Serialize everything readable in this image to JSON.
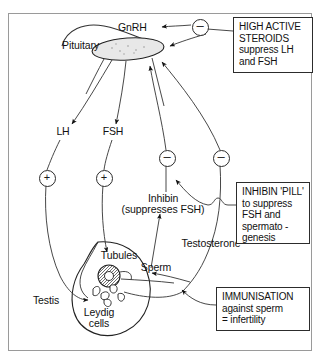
{
  "diagram": {
    "frame": {
      "border_color": "#9a9a9a"
    },
    "organs": [
      {
        "name": "pituitary",
        "label": "Pituitary",
        "x": 98,
        "y": 46
      },
      {
        "name": "testis",
        "label": "Testis",
        "x": 46,
        "y": 300
      },
      {
        "name": "tubules",
        "label": "Tubules",
        "x": 119,
        "y": 255
      },
      {
        "name": "leydig-cells",
        "label": "Leydig\ncells",
        "line1": "Leydig",
        "line2": "cells",
        "x": 99,
        "y": 312
      }
    ],
    "hormones": [
      {
        "name": "gnrh",
        "label": "GnRH",
        "x": 143,
        "y": 29
      },
      {
        "name": "lh",
        "label": "LH",
        "x": 63,
        "y": 133
      },
      {
        "name": "fsh",
        "label": "FSH",
        "x": 113,
        "y": 133
      },
      {
        "name": "inhibin",
        "line1": "Inhibin",
        "line2": "(suppresses FSH)",
        "x": 163,
        "y": 198
      },
      {
        "name": "testosterone",
        "label": "Testosterone",
        "x": 211,
        "y": 244
      },
      {
        "name": "sperm",
        "label": "Sperm",
        "x": 156,
        "y": 268
      }
    ],
    "signs": [
      {
        "name": "sign-steroids-negative",
        "symbol": "–",
        "type": "minus",
        "x": 199,
        "y": 26
      },
      {
        "name": "sign-lh-positive",
        "symbol": "+",
        "type": "plus",
        "x": 46,
        "y": 177
      },
      {
        "name": "sign-fsh-positive",
        "symbol": "+",
        "type": "plus",
        "x": 103,
        "y": 177
      },
      {
        "name": "sign-inhibin-negative",
        "symbol": "–",
        "type": "minus",
        "x": 166,
        "y": 157
      },
      {
        "name": "sign-testosterone-negative",
        "symbol": "–",
        "type": "minus",
        "x": 220,
        "y": 157
      }
    ],
    "notes": [
      {
        "name": "note-high-active-steroids",
        "text": "HIGH ACTIVE\nSTEROIDS\nsuppress LH\nand FSH"
      },
      {
        "name": "note-inhibin-pill",
        "text": "INHIBIN 'PILL'\nto suppress\nFSH and\nspermato -\ngenesis"
      },
      {
        "name": "note-immunisation",
        "text": "IMMUNISATION\nagainst sperm\n= infertility"
      }
    ]
  }
}
